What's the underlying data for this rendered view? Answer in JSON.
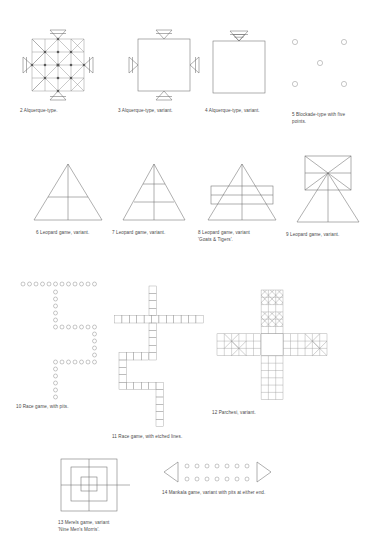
{
  "page": {
    "background_color": "#ffffff",
    "line_color": "#6e6e6e",
    "text_color": "#4a4a4a"
  },
  "figures": [
    {
      "number": "2",
      "caption": "2  Alquerque-type.",
      "type": "alquerque-grid-with-four-triangles",
      "x": 18,
      "y": 32,
      "grid": {
        "rows": 4,
        "cols": 4,
        "cell": 13,
        "diagonals": true,
        "intersection_dots": 9
      },
      "appendages": {
        "top": 1,
        "bottom": 1,
        "left": 1,
        "right": 1,
        "shape": "triangle-with-bar"
      }
    },
    {
      "number": "3",
      "caption": "3  Alquerque-type, variant.",
      "type": "plain-square-with-four-triangles",
      "x": 129,
      "y": 32,
      "square": {
        "size": 52
      },
      "appendages": {
        "top": 1,
        "bottom": 1,
        "left": 1,
        "right": 1,
        "shape": "triangle-with-bar"
      }
    },
    {
      "number": "4",
      "caption": "4  Alquerque-type, variant.",
      "type": "plain-square-with-one-double-triangle",
      "x": 213,
      "y": 32,
      "square": {
        "size": 52
      },
      "appendages": {
        "top": 2,
        "bottom": 0,
        "left": 0,
        "right": 0,
        "shape": "nested-triangles"
      }
    },
    {
      "number": "5",
      "caption": "5  Blockade-type with five\npoints.",
      "type": "five-point-blockade",
      "x": 292,
      "y": 36,
      "points": [
        {
          "x": 4,
          "y": 3
        },
        {
          "x": 52,
          "y": 3
        },
        {
          "x": 28,
          "y": 24
        },
        {
          "x": 4,
          "y": 45
        },
        {
          "x": 52,
          "y": 45
        }
      ],
      "point_radius": 2.6
    },
    {
      "number": "6",
      "caption": "6  Leopard game, variant.",
      "type": "triangle-with-one-crossbar",
      "x": 30,
      "y": 160,
      "triangle": {
        "base": 68,
        "height": 58
      },
      "horizontal_lines": 1,
      "vertical_center_line": true
    },
    {
      "number": "7",
      "caption": "7  Leopard game, variant.",
      "type": "triangle-with-two-crossbars",
      "x": 118,
      "y": 160,
      "triangle": {
        "base": 62,
        "height": 58
      },
      "horizontal_lines": 2,
      "vertical_center_line": true
    },
    {
      "number": "8",
      "caption": "8  Leopard game, variant\n'Goats & Tigers'.",
      "type": "triangle-with-overlaid-rectangle",
      "x": 203,
      "y": 160,
      "triangle": {
        "base": 72,
        "height": 58
      },
      "rectangle": {
        "width": 62,
        "height": 17,
        "rows": 2
      },
      "vertical_center_line": true
    },
    {
      "number": "9",
      "caption": "9  Leopard game, variant.",
      "type": "rectangle-with-x-over-triangle",
      "x": 293,
      "y": 155,
      "rectangle": {
        "width": 46,
        "height": 32,
        "diagonals": true,
        "midline": true
      },
      "triangle": {
        "base": 62,
        "height": 52
      },
      "vertical_center_line": true
    },
    {
      "number": "10",
      "caption": "10  Race game, with pits.",
      "type": "zigzag-pit-track",
      "x": 22,
      "y": 282,
      "pit_radius": 2.0,
      "pit_spacing": 6.2,
      "segments": [
        {
          "dir": "right",
          "count": 12
        },
        {
          "dir": "down",
          "count": 5
        },
        {
          "dir": "right",
          "count": 6
        },
        {
          "dir": "down",
          "count": 5
        },
        {
          "dir": "left",
          "count": 6
        },
        {
          "dir": "down",
          "count": 6
        }
      ]
    },
    {
      "number": "11",
      "caption": "11  Race game, with etched lines.",
      "type": "zigzag-cell-track",
      "x": 116,
      "y": 286,
      "cell": 7.4,
      "segments": [
        {
          "dir": "down",
          "count": 4,
          "start_col": 4,
          "start_row": 0
        },
        {
          "dir": "right",
          "count": 13,
          "start_col": 0,
          "start_row": 4
        },
        {
          "dir": "down",
          "count": 4,
          "start_col": 4,
          "start_row": 5
        },
        {
          "dir": "left",
          "count": 5,
          "start_col": 0,
          "start_row": 9
        },
        {
          "dir": "down",
          "count": 3,
          "start_col": 0,
          "start_row": 10
        },
        {
          "dir": "right",
          "count": 6,
          "start_col": 0,
          "start_row": 13
        },
        {
          "dir": "down",
          "count": 5,
          "start_col": 5,
          "start_row": 14
        }
      ]
    },
    {
      "number": "12",
      "caption": "12  Parchesi, variant.",
      "type": "cross-shaped-parcheesi",
      "x": 214,
      "y": 292,
      "cell": 7.3,
      "arm_width": 3,
      "arm_length": 6,
      "center_size": 3,
      "marked_cells_note": "hatched cells in top arm; X-marked cells in left and right arms"
    },
    {
      "number": "13",
      "caption": "13  Merels game, variant\n'Nine Men's Morris'.",
      "type": "nine-mens-morris",
      "x": 62,
      "y": 458,
      "squares": [
        56,
        36,
        16
      ],
      "connector_lines": 4
    },
    {
      "number": "14",
      "caption": "14  Mankala game, variant with pits at either end.",
      "type": "mankala-two-rows-with-end-pits",
      "x": 162,
      "y": 460,
      "rows": 2,
      "pits_per_row": 7,
      "pit_radius": 2.0,
      "end_shapes": {
        "left": "triangle-pointing-left",
        "right": "triangle-pointing-right"
      }
    }
  ]
}
